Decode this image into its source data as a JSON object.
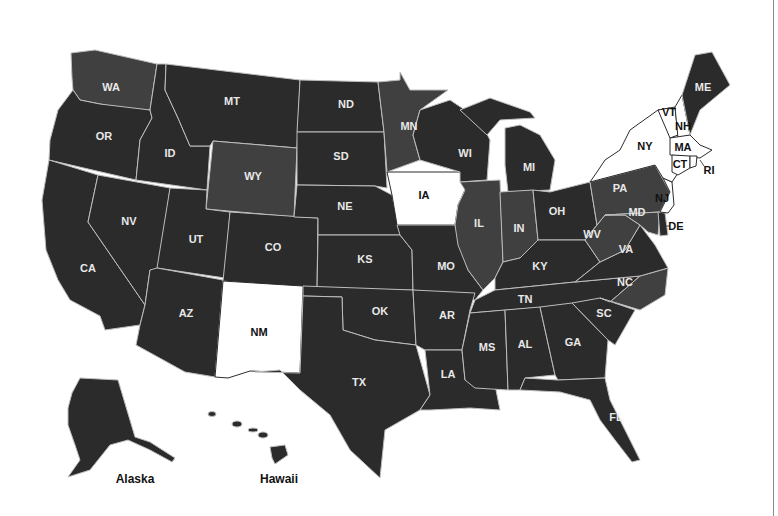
{
  "map": {
    "title": "United States map by state",
    "colors": {
      "dark": "#2b2b2b",
      "medium": "#404040",
      "white": "#ffffff",
      "border": "#bdbdbd"
    },
    "states": {
      "WA": {
        "label": "WA",
        "shade": "medium"
      },
      "OR": {
        "label": "OR",
        "shade": "dark"
      },
      "CA": {
        "label": "CA",
        "shade": "dark"
      },
      "ID": {
        "label": "ID",
        "shade": "dark"
      },
      "NV": {
        "label": "NV",
        "shade": "dark"
      },
      "MT": {
        "label": "MT",
        "shade": "dark"
      },
      "WY": {
        "label": "WY",
        "shade": "medium"
      },
      "UT": {
        "label": "UT",
        "shade": "dark"
      },
      "AZ": {
        "label": "AZ",
        "shade": "dark"
      },
      "CO": {
        "label": "CO",
        "shade": "dark"
      },
      "NM": {
        "label": "NM",
        "shade": "white"
      },
      "ND": {
        "label": "ND",
        "shade": "dark"
      },
      "SD": {
        "label": "SD",
        "shade": "dark"
      },
      "NE": {
        "label": "NE",
        "shade": "dark"
      },
      "KS": {
        "label": "KS",
        "shade": "dark"
      },
      "OK": {
        "label": "OK",
        "shade": "dark"
      },
      "TX": {
        "label": "TX",
        "shade": "dark"
      },
      "MN": {
        "label": "MN",
        "shade": "medium"
      },
      "IA": {
        "label": "IA",
        "shade": "white"
      },
      "MO": {
        "label": "MO",
        "shade": "dark"
      },
      "AR": {
        "label": "AR",
        "shade": "dark"
      },
      "LA": {
        "label": "LA",
        "shade": "dark"
      },
      "WI": {
        "label": "WI",
        "shade": "dark"
      },
      "IL": {
        "label": "IL",
        "shade": "medium"
      },
      "MI": {
        "label": "MI",
        "shade": "dark"
      },
      "IN": {
        "label": "IN",
        "shade": "medium"
      },
      "OH": {
        "label": "OH",
        "shade": "dark"
      },
      "KY": {
        "label": "KY",
        "shade": "dark"
      },
      "TN": {
        "label": "TN",
        "shade": "dark"
      },
      "MS": {
        "label": "MS",
        "shade": "dark"
      },
      "AL": {
        "label": "AL",
        "shade": "dark"
      },
      "GA": {
        "label": "GA",
        "shade": "dark"
      },
      "FL": {
        "label": "FL",
        "shade": "dark"
      },
      "SC": {
        "label": "SC",
        "shade": "dark"
      },
      "NC": {
        "label": "NC",
        "shade": "medium"
      },
      "VA": {
        "label": "VA",
        "shade": "dark"
      },
      "WV": {
        "label": "WV",
        "shade": "medium"
      },
      "PA": {
        "label": "PA",
        "shade": "medium"
      },
      "MD": {
        "label": "MD",
        "shade": "medium"
      },
      "DE": {
        "label": "DE",
        "shade": "dark"
      },
      "NJ": {
        "label": "NJ",
        "shade": "white"
      },
      "NY": {
        "label": "NY",
        "shade": "white"
      },
      "CT": {
        "label": "CT",
        "shade": "white"
      },
      "RI": {
        "label": "RI",
        "shade": "white"
      },
      "MA": {
        "label": "MA",
        "shade": "white"
      },
      "VT": {
        "label": "VT",
        "shade": "white"
      },
      "NH": {
        "label": "NH",
        "shade": "white"
      },
      "ME": {
        "label": "ME",
        "shade": "dark"
      }
    },
    "insets": {
      "alaska": {
        "label": "Alaska",
        "shade": "dark"
      },
      "hawaii": {
        "label": "Hawaii",
        "shade": "dark"
      }
    }
  }
}
